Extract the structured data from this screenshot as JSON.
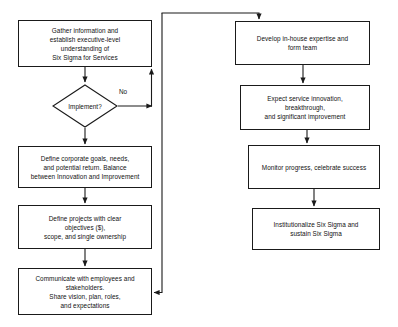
{
  "diagram": {
    "type": "flowchart",
    "canvas": {
      "width": 398,
      "height": 327,
      "background": "#ffffff"
    },
    "stroke_color": "#1a1a1a",
    "text_color": "#111111",
    "nodes": [
      {
        "id": "gather",
        "shape": "process",
        "text": "Gather information and\nestablish executive-level\nunderstanding of\nSix Sigma for Services",
        "x": 18,
        "y": 20,
        "w": 134,
        "h": 47
      },
      {
        "id": "implement",
        "shape": "decision",
        "text": "Implement?",
        "x": 52,
        "y": 84,
        "w": 66,
        "h": 44
      },
      {
        "id": "define-goals",
        "shape": "process",
        "text": "Define corporate goals, needs,\nand potential return. Balance\nbetween Innovation and Improvement",
        "x": 18,
        "y": 146,
        "w": 134,
        "h": 42
      },
      {
        "id": "define-projects",
        "shape": "process",
        "text": "Define projects with clear\nobjectives ($),\nscope, and single ownership",
        "x": 18,
        "y": 205,
        "w": 134,
        "h": 44
      },
      {
        "id": "communicate",
        "shape": "process",
        "text": "Communicate with employees and\nstakeholders.\nShare vision, plan,  roles,\nand expectations",
        "x": 18,
        "y": 268,
        "w": 134,
        "h": 47
      },
      {
        "id": "develop-team",
        "shape": "process",
        "text": "Develop in-house expertise and\nform team",
        "x": 235,
        "y": 21,
        "w": 135,
        "h": 44
      },
      {
        "id": "expect-innovation",
        "shape": "process",
        "text": "Expect service innovation,\nbreakthrough,\nand significant improvement",
        "x": 240,
        "y": 85,
        "w": 130,
        "h": 45
      },
      {
        "id": "monitor",
        "shape": "process",
        "text": "Monitor progress, celebrate success",
        "x": 248,
        "y": 145,
        "w": 132,
        "h": 44
      },
      {
        "id": "institutionalize",
        "shape": "process",
        "text": "Institutionalize Six Sigma and\nsustain Six Sigma",
        "x": 252,
        "y": 208,
        "w": 128,
        "h": 42
      }
    ],
    "edge_labels": [
      {
        "id": "no-label",
        "text": "No",
        "x": 119,
        "y": 88
      }
    ],
    "edges": [
      {
        "from": "gather",
        "to": "implement",
        "kind": "straight-down"
      },
      {
        "from": "implement",
        "to": "define-goals",
        "kind": "straight-down"
      },
      {
        "from": "implement",
        "to": "gather",
        "kind": "no-loop-right-up",
        "label": "No"
      },
      {
        "from": "define-goals",
        "to": "define-projects",
        "kind": "straight-down"
      },
      {
        "from": "define-projects",
        "to": "communicate",
        "kind": "straight-down"
      },
      {
        "from": "communicate",
        "to": "develop-team",
        "kind": "right-up-over-down"
      },
      {
        "from": "develop-team",
        "to": "expect-innovation",
        "kind": "straight-down"
      },
      {
        "from": "expect-innovation",
        "to": "monitor",
        "kind": "straight-down"
      },
      {
        "from": "monitor",
        "to": "institutionalize",
        "kind": "straight-down"
      }
    ]
  }
}
